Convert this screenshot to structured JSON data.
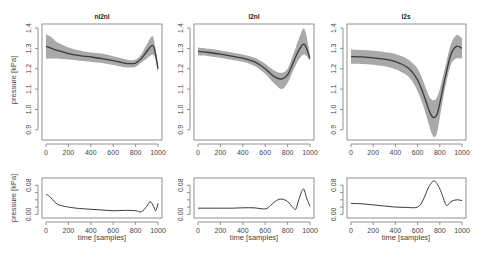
{
  "chart_data": [
    {
      "type": "line",
      "title": "nl2nl",
      "xlabel": "",
      "ylabel": "pressure [kPa]",
      "xlim": [
        0,
        1000
      ],
      "ylim": [
        0.85,
        1.42
      ],
      "xticks": [
        0,
        200,
        400,
        600,
        800,
        1000
      ],
      "yticks": [
        0.9,
        1.0,
        1.1,
        1.2,
        1.3,
        1.4
      ],
      "x": [
        0,
        50,
        100,
        200,
        300,
        400,
        500,
        600,
        700,
        750,
        800,
        850,
        900,
        950,
        975,
        1000
      ],
      "series": [
        {
          "name": "mean",
          "values": [
            1.31,
            1.3,
            1.29,
            1.275,
            1.265,
            1.258,
            1.25,
            1.24,
            1.228,
            1.225,
            1.228,
            1.25,
            1.285,
            1.315,
            1.28,
            1.2
          ]
        },
        {
          "name": "upper",
          "values": [
            1.37,
            1.355,
            1.33,
            1.305,
            1.29,
            1.28,
            1.275,
            1.262,
            1.248,
            1.242,
            1.245,
            1.27,
            1.32,
            1.36,
            1.31,
            1.22
          ]
        },
        {
          "name": "lower",
          "values": [
            1.25,
            1.25,
            1.25,
            1.245,
            1.24,
            1.235,
            1.228,
            1.218,
            1.207,
            1.206,
            1.21,
            1.23,
            1.25,
            1.27,
            1.25,
            1.18
          ]
        }
      ]
    },
    {
      "type": "line",
      "title": "l2nl",
      "xlabel": "",
      "ylabel": "",
      "xlim": [
        0,
        1000
      ],
      "ylim": [
        0.85,
        1.42
      ],
      "xticks": [
        0,
        200,
        400,
        600,
        800,
        1000
      ],
      "yticks": [
        0.9,
        1.0,
        1.1,
        1.2,
        1.3,
        1.4
      ],
      "x": [
        0,
        100,
        200,
        300,
        400,
        500,
        550,
        600,
        650,
        700,
        750,
        800,
        850,
        900,
        950,
        1000
      ],
      "series": [
        {
          "name": "mean",
          "values": [
            1.285,
            1.28,
            1.272,
            1.262,
            1.252,
            1.235,
            1.22,
            1.2,
            1.175,
            1.155,
            1.15,
            1.17,
            1.23,
            1.29,
            1.32,
            1.25
          ]
        },
        {
          "name": "upper",
          "values": [
            1.305,
            1.298,
            1.29,
            1.28,
            1.27,
            1.255,
            1.242,
            1.225,
            1.202,
            1.185,
            1.18,
            1.2,
            1.27,
            1.345,
            1.395,
            1.27
          ]
        },
        {
          "name": "lower",
          "values": [
            1.265,
            1.262,
            1.254,
            1.244,
            1.234,
            1.215,
            1.198,
            1.175,
            1.145,
            1.118,
            1.1,
            1.13,
            1.19,
            1.245,
            1.27,
            1.24
          ]
        }
      ]
    },
    {
      "type": "line",
      "title": "l2s",
      "xlabel": "",
      "ylabel": "",
      "xlim": [
        0,
        1000
      ],
      "ylim": [
        0.85,
        1.42
      ],
      "xticks": [
        0,
        200,
        400,
        600,
        800,
        1000
      ],
      "yticks": [
        0.9,
        1.0,
        1.1,
        1.2,
        1.3,
        1.4
      ],
      "x": [
        0,
        100,
        200,
        300,
        400,
        500,
        550,
        600,
        650,
        700,
        725,
        750,
        775,
        800,
        850,
        900,
        950,
        1000
      ],
      "series": [
        {
          "name": "mean",
          "values": [
            1.26,
            1.258,
            1.254,
            1.247,
            1.235,
            1.21,
            1.185,
            1.145,
            1.08,
            1.0,
            0.97,
            0.96,
            0.975,
            1.03,
            1.16,
            1.27,
            1.31,
            1.3
          ]
        },
        {
          "name": "upper",
          "values": [
            1.295,
            1.292,
            1.288,
            1.282,
            1.272,
            1.25,
            1.23,
            1.2,
            1.14,
            1.07,
            1.05,
            1.045,
            1.06,
            1.1,
            1.21,
            1.32,
            1.365,
            1.35
          ]
        },
        {
          "name": "lower",
          "values": [
            1.225,
            1.224,
            1.22,
            1.212,
            1.198,
            1.17,
            1.14,
            1.09,
            1.02,
            0.93,
            0.885,
            0.865,
            0.885,
            0.96,
            1.11,
            1.22,
            1.25,
            1.25
          ]
        }
      ]
    },
    {
      "type": "line",
      "title": "",
      "xlabel": "time [samples]",
      "ylabel": "pressure [kPa]",
      "xlim": [
        0,
        1000
      ],
      "ylim": [
        -0.01,
        0.1
      ],
      "xticks": [
        0,
        200,
        400,
        600,
        800,
        1000
      ],
      "yticks": [
        0.0,
        0.08
      ],
      "yminor_ticks": [
        0.02,
        0.04,
        0.06
      ],
      "x": [
        0,
        30,
        60,
        100,
        150,
        200,
        300,
        400,
        500,
        600,
        700,
        800,
        850,
        900,
        930,
        960,
        980,
        1000
      ],
      "series": [
        {
          "name": "sd",
          "values": [
            0.055,
            0.05,
            0.04,
            0.028,
            0.023,
            0.02,
            0.016,
            0.014,
            0.012,
            0.01,
            0.011,
            0.01,
            0.007,
            0.022,
            0.035,
            0.022,
            0.01,
            0.03
          ]
        }
      ]
    },
    {
      "type": "line",
      "title": "",
      "xlabel": "time [samples]",
      "ylabel": "",
      "xlim": [
        0,
        1000
      ],
      "ylim": [
        -0.01,
        0.1
      ],
      "xticks": [
        0,
        200,
        400,
        600,
        800,
        1000
      ],
      "yticks": [
        0.0,
        0.08
      ],
      "yminor_ticks": [
        0.02,
        0.04,
        0.06
      ],
      "x": [
        0,
        100,
        200,
        300,
        400,
        500,
        600,
        650,
        700,
        750,
        800,
        850,
        875,
        900,
        940,
        970,
        1000
      ],
      "series": [
        {
          "name": "sd",
          "values": [
            0.017,
            0.017,
            0.017,
            0.017,
            0.018,
            0.018,
            0.015,
            0.025,
            0.038,
            0.042,
            0.035,
            0.018,
            0.015,
            0.04,
            0.07,
            0.045,
            0.022
          ]
        }
      ]
    },
    {
      "type": "line",
      "title": "",
      "xlabel": "time [samples]",
      "ylabel": "",
      "xlim": [
        0,
        1000
      ],
      "ylim": [
        -0.01,
        0.1
      ],
      "xticks": [
        0,
        200,
        400,
        600,
        800,
        1000
      ],
      "yticks": [
        0.0,
        0.08
      ],
      "yminor_ticks": [
        0.02,
        0.04,
        0.06
      ],
      "x": [
        0,
        100,
        200,
        300,
        400,
        500,
        600,
        650,
        700,
        750,
        800,
        850,
        870,
        900,
        950,
        1000
      ],
      "series": [
        {
          "name": "sd",
          "values": [
            0.03,
            0.029,
            0.026,
            0.023,
            0.02,
            0.019,
            0.02,
            0.04,
            0.075,
            0.092,
            0.07,
            0.03,
            0.025,
            0.035,
            0.04,
            0.038
          ]
        }
      ]
    }
  ],
  "panels": [
    {
      "title": "nl2nl",
      "ylabel": "pressure [kPa]"
    },
    {
      "title": "l2nl",
      "ylabel": ""
    },
    {
      "title": "l2s",
      "ylabel": ""
    }
  ],
  "bottom_panels": [
    {
      "xlabel": "time [samples]",
      "ylabel": "pressure  [kPa]"
    },
    {
      "xlabel": "time [samples]",
      "ylabel": ""
    },
    {
      "xlabel": "time [samples]",
      "ylabel": ""
    }
  ],
  "colors": {
    "band": "#a9a9a9",
    "line": "#3a3a3a",
    "axis": "#777777"
  }
}
